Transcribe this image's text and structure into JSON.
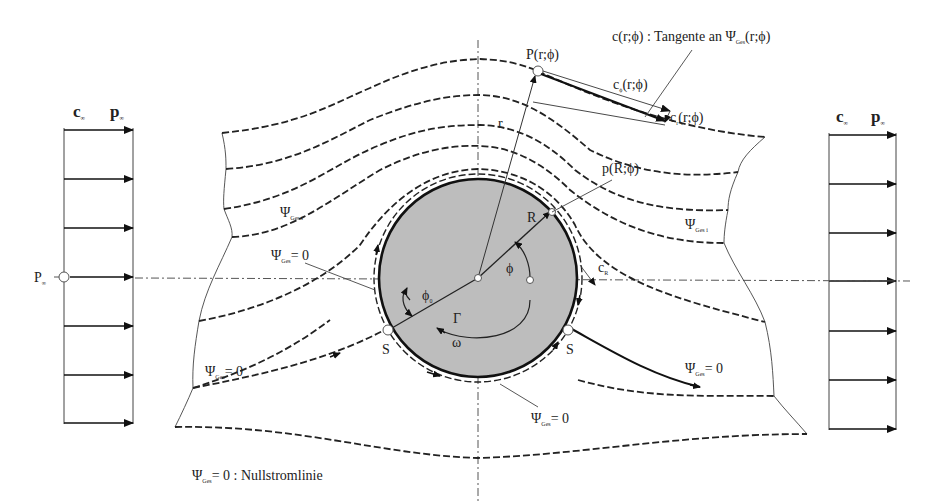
{
  "diagram": {
    "left_profile": {
      "velocity_label": "c",
      "velocity_sub": "∞",
      "pressure_label": "p",
      "pressure_sub": "∞",
      "point_label": "P",
      "point_sub": "∞",
      "arrow_count": 7
    },
    "right_profile": {
      "velocity_label": "c",
      "velocity_sub": "∞",
      "pressure_label": "p",
      "pressure_sub": "∞",
      "arrow_count": 7
    },
    "labels": {
      "tangent_note": "c(r;ϕ) : Tangente an Ψ",
      "tangent_note_sub": "Ges",
      "tangent_note_tail": "(r;ϕ)",
      "point_P": "P(r;ϕ)",
      "c_phi": "c",
      "c_phi_sub": "ϕ",
      "c_phi_tail": "(r;ϕ)",
      "c_r": "c",
      "c_r_sub": "r",
      "c_r_tail": "(r;ϕ)",
      "r": "r",
      "R": "R",
      "p_R": "p(R;ϕ)",
      "c_R": "c",
      "c_R_sub": "R",
      "phi": "ϕ",
      "phi0": "ϕ",
      "phi0_sub": "0",
      "Gamma": "Γ",
      "omega": "ω",
      "S_left": "S",
      "S_right": "S",
      "psi_i_left": "Ψ",
      "psi_i_left_sub": "Ges i",
      "psi_i_right": "Ψ",
      "psi_i_right_sub": "Ges i",
      "psi0_upper": "Ψ",
      "psi0_upper_sub": "Ges",
      "psi0_upper_tail": "= 0",
      "psi0_lower_left": "Ψ",
      "psi0_lower_left_sub": "Ges",
      "psi0_lower_left_tail": "= 0",
      "psi0_lower_right": "Ψ",
      "psi0_lower_right_sub": "Ges",
      "psi0_lower_right_tail": "= 0",
      "psi0_bottom": "Ψ",
      "psi0_bottom_sub": "Ges",
      "psi0_bottom_tail": "= 0",
      "legend": "Ψ",
      "legend_sub": "Ges",
      "legend_tail": "= 0 : Nullstromlinie"
    },
    "colors": {
      "cylinder_fill": "#bdbdbd",
      "line": "#222222"
    }
  }
}
